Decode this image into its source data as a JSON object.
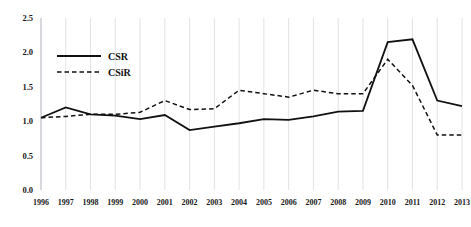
{
  "chart_data": {
    "type": "line",
    "title": "",
    "subtitle": "",
    "xlabel": "",
    "ylabel": "",
    "grid": "vertical",
    "legend_position": "upper-left-inside",
    "categories": [
      "1996",
      "1997",
      "1998",
      "1999",
      "2000",
      "2001",
      "2002",
      "2003",
      "2004",
      "2005",
      "2006",
      "2007",
      "2008",
      "2009",
      "2010",
      "2011",
      "2012",
      "2013"
    ],
    "x": [
      1996,
      1997,
      1998,
      1999,
      2000,
      2001,
      2002,
      2003,
      2004,
      2005,
      2006,
      2007,
      2008,
      2009,
      2010,
      2011,
      2012,
      2013
    ],
    "xlim": [
      1996,
      2013
    ],
    "ylim": [
      0.0,
      2.5
    ],
    "yticks": [
      "0.0",
      "0.5",
      "1.0",
      "1.5",
      "2.0",
      "2.5"
    ],
    "ytick_values": [
      0.0,
      0.5,
      1.0,
      1.5,
      2.0,
      2.5
    ],
    "series": [
      {
        "name": "CSR",
        "style": "solid",
        "color": "#111111",
        "values": [
          1.05,
          1.2,
          1.1,
          1.08,
          1.03,
          1.09,
          0.87,
          0.92,
          0.97,
          1.03,
          1.02,
          1.07,
          1.14,
          1.15,
          2.15,
          2.19,
          1.3,
          1.22
        ]
      },
      {
        "name": "CSiR",
        "style": "dashed",
        "color": "#111111",
        "values": [
          1.05,
          1.07,
          1.1,
          1.1,
          1.13,
          1.3,
          1.17,
          1.18,
          1.45,
          1.4,
          1.35,
          1.45,
          1.4,
          1.4,
          1.9,
          1.52,
          0.8,
          0.8
        ]
      }
    ]
  },
  "legend": {
    "entries": [
      {
        "label": "CSR",
        "style": "solid"
      },
      {
        "label": "CSiR",
        "style": "dashed"
      }
    ]
  },
  "colors": {
    "line": "#111111",
    "grid": "#e3e3e6",
    "axis": "#c9c9cf",
    "background": "#ffffff"
  }
}
